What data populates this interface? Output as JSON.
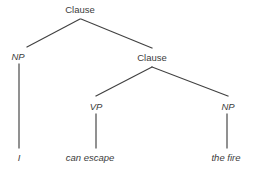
{
  "figure": {
    "kind": "syntax-tree-diagram",
    "sentence": "I can escape the fire",
    "background_color": "#ffffff",
    "line_color": "#404040",
    "text_color": "#3c3c3c"
  },
  "nodes": {
    "root_clause": {
      "label": "Clause",
      "x": 80,
      "y": 4,
      "style": "upright"
    },
    "subject_np": {
      "label": "NP",
      "x": 18,
      "y": 51,
      "style": "italic"
    },
    "embedded_clause": {
      "label": "Clause",
      "x": 152,
      "y": 52,
      "style": "upright"
    },
    "vp": {
      "label": "VP",
      "x": 96,
      "y": 101,
      "style": "italic"
    },
    "object_np": {
      "label": "NP",
      "x": 228,
      "y": 101,
      "style": "italic"
    }
  },
  "leaves": {
    "subject_word": {
      "label": "I",
      "x": 19,
      "y": 152
    },
    "verb_phrase_words": {
      "label": "can escape",
      "x": 90,
      "y": 152
    },
    "object_words": {
      "label": "the fire",
      "x": 226,
      "y": 152
    }
  },
  "edges": [
    {
      "name": "root-to-subject-np",
      "x1": 80,
      "y1": 19,
      "x2": 27,
      "y2": 47
    },
    {
      "name": "root-to-embedded-clause",
      "x1": 81,
      "y1": 19,
      "x2": 152,
      "y2": 48
    },
    {
      "name": "embedded-clause-to-vp",
      "x1": 152,
      "y1": 67,
      "x2": 96,
      "y2": 96
    },
    {
      "name": "embedded-clause-to-object-np",
      "x1": 152,
      "y1": 67,
      "x2": 228,
      "y2": 96
    },
    {
      "name": "subject-np-to-word",
      "x1": 19,
      "y1": 64,
      "x2": 19,
      "y2": 148
    },
    {
      "name": "vp-to-words",
      "x1": 96,
      "y1": 114,
      "x2": 96,
      "y2": 148
    },
    {
      "name": "object-np-to-words",
      "x1": 227,
      "y1": 114,
      "x2": 227,
      "y2": 148
    }
  ]
}
